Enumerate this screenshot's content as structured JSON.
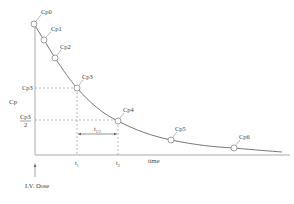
{
  "diagram": {
    "y_axis_label": "Cp",
    "x_axis_label": "time",
    "dose_label": "I.V. Dose",
    "half_life_label": "t",
    "half_life_sub": "1/2",
    "t1_label": "t",
    "t1_sub": "1",
    "t2_label": "t",
    "t2_sub": "2",
    "cp3_ref_label": "Cp3",
    "cp3_half_num": "Cp3",
    "cp3_half_den": "2",
    "points": [
      {
        "label": "Cp0",
        "x": 34,
        "y": 24
      },
      {
        "label": "Cp1",
        "x": 44,
        "y": 40
      },
      {
        "label": "Cp2",
        "x": 55,
        "y": 58
      },
      {
        "label": "Cp3",
        "x": 77,
        "y": 88
      },
      {
        "label": "Cp4",
        "x": 118,
        "y": 121
      },
      {
        "label": "Cp5",
        "x": 171,
        "y": 140
      },
      {
        "label": "Cp6",
        "x": 234,
        "y": 148
      }
    ],
    "colors": {
      "curve": "#666666",
      "axis": "#aaaaaa",
      "dashed": "#999999",
      "text": "#444444"
    }
  }
}
